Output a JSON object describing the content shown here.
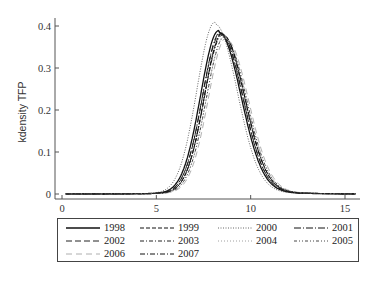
{
  "chart_data": {
    "type": "line",
    "title": "",
    "xlabel": "",
    "ylabel": "kdensity TFP",
    "xlim": [
      -0.3,
      15.8
    ],
    "ylim": [
      0,
      0.42
    ],
    "xticks": [
      0,
      5,
      10,
      15
    ],
    "yticks": [
      0,
      0.1,
      0.2,
      0.3,
      0.4
    ],
    "xtick_labels": [
      "0",
      "5",
      "10",
      "15"
    ],
    "ytick_labels": [
      "0",
      "0.1",
      "0.2",
      "0.3",
      "0.4"
    ],
    "grid": false,
    "legend_position": "bottom",
    "x": [
      0,
      2,
      4,
      5,
      5.5,
      6,
      6.5,
      7,
      7.5,
      8,
      8.3,
      8.6,
      9,
      9.5,
      10,
      10.5,
      11,
      12,
      13,
      15
    ],
    "series": [
      {
        "name": "1998",
        "dash": "solid",
        "peak_x": 8.3,
        "peak_y": 0.385
      },
      {
        "name": "1999",
        "dash": "dash",
        "peak_x": 8.5,
        "peak_y": 0.38
      },
      {
        "name": "2000",
        "dash": "dot",
        "peak_x": 8.1,
        "peak_y": 0.405
      },
      {
        "name": "2001",
        "dash": "longdash-dot",
        "peak_x": 8.4,
        "peak_y": 0.382
      },
      {
        "name": "2002",
        "dash": "longdash",
        "peak_x": 8.4,
        "peak_y": 0.378
      },
      {
        "name": "2003",
        "dash": "dash-dot",
        "peak_x": 8.5,
        "peak_y": 0.375
      },
      {
        "name": "2004",
        "dash": "sparse-dot",
        "peak_x": 8.6,
        "peak_y": 0.372
      },
      {
        "name": "2005",
        "dash": "dash-dot-dot",
        "peak_x": 8.6,
        "peak_y": 0.37
      },
      {
        "name": "2006",
        "dash": "light-longdash",
        "peak_x": 8.7,
        "peak_y": 0.368
      },
      {
        "name": "2007",
        "dash": "dash-dot-long",
        "peak_x": 8.5,
        "peak_y": 0.38
      }
    ],
    "annotations": []
  },
  "legend": {
    "items": [
      {
        "label": "1998"
      },
      {
        "label": "1999"
      },
      {
        "label": "2000"
      },
      {
        "label": "2001"
      },
      {
        "label": "2002"
      },
      {
        "label": "2003"
      },
      {
        "label": "2004"
      },
      {
        "label": "2005"
      },
      {
        "label": "2006"
      },
      {
        "label": "2007"
      }
    ]
  }
}
